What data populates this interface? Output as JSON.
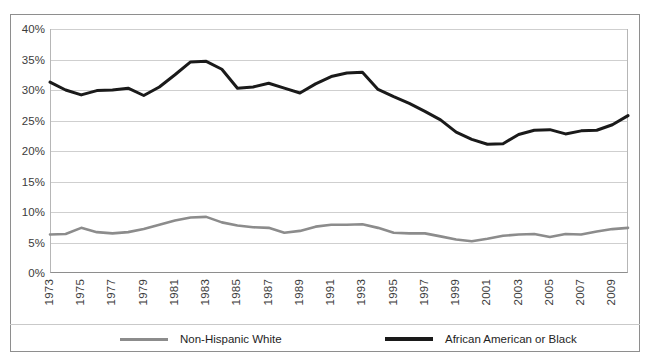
{
  "chart_data": {
    "type": "line",
    "title": "",
    "subtitle": "",
    "xlabel": "",
    "ylabel": "",
    "grid": true,
    "legend_position": "bottom",
    "ylim": [
      0,
      40
    ],
    "yticks": [
      0,
      5,
      10,
      15,
      20,
      25,
      30,
      35,
      40
    ],
    "ytick_labels": [
      "0%",
      "5%",
      "10%",
      "15%",
      "20%",
      "25%",
      "30%",
      "35%",
      "40%"
    ],
    "xlim": [
      1973,
      2010
    ],
    "x": [
      1973,
      1974,
      1975,
      1976,
      1977,
      1978,
      1979,
      1980,
      1981,
      1982,
      1983,
      1984,
      1985,
      1986,
      1987,
      1988,
      1989,
      1990,
      1991,
      1992,
      1993,
      1994,
      1995,
      1996,
      1997,
      1998,
      1999,
      2000,
      2001,
      2002,
      2003,
      2004,
      2005,
      2006,
      2007,
      2008,
      2009,
      2010
    ],
    "xtick_labels": [
      "1973",
      "1975",
      "1977",
      "1979",
      "1981",
      "1983",
      "1985",
      "1987",
      "1989",
      "1991",
      "1993",
      "1995",
      "1997",
      "1999",
      "2001",
      "2003",
      "2005",
      "2007",
      "2009"
    ],
    "xticks": [
      1973,
      1975,
      1977,
      1979,
      1981,
      1983,
      1985,
      1987,
      1989,
      1991,
      1993,
      1995,
      1997,
      1999,
      2001,
      2003,
      2005,
      2007,
      2009
    ],
    "series": [
      {
        "name": "Non-Hispanic White",
        "color": "#8c8c8c",
        "width": 2.6,
        "values": [
          6.3,
          6.4,
          7.4,
          6.7,
          6.5,
          6.7,
          7.2,
          7.9,
          8.6,
          9.1,
          9.2,
          8.3,
          7.8,
          7.5,
          7.4,
          6.6,
          6.9,
          7.6,
          7.9,
          7.9,
          8.0,
          7.4,
          6.6,
          6.5,
          6.5,
          6.0,
          5.5,
          5.2,
          5.6,
          6.1,
          6.3,
          6.4,
          5.9,
          6.4,
          6.3,
          6.8,
          7.2,
          7.4
        ]
      },
      {
        "name": "African American or Black",
        "color": "#1a1a1a",
        "width": 3.0,
        "values": [
          31.3,
          30.0,
          29.2,
          29.9,
          30.0,
          30.3,
          29.1,
          30.5,
          32.5,
          34.6,
          34.7,
          33.4,
          30.3,
          30.5,
          31.1,
          30.3,
          29.5,
          31.0,
          32.2,
          32.8,
          32.9,
          30.1,
          28.9,
          27.8,
          26.5,
          25.1,
          23.1,
          21.9,
          21.1,
          21.2,
          22.7,
          23.4,
          23.5,
          22.8,
          23.3,
          23.4,
          24.3,
          25.8
        ]
      }
    ]
  },
  "legend": {
    "items": [
      {
        "label": "Non-Hispanic White",
        "color": "#8c8c8c",
        "width": 3
      },
      {
        "label": "African American or Black",
        "color": "#1a1a1a",
        "width": 4
      }
    ]
  }
}
